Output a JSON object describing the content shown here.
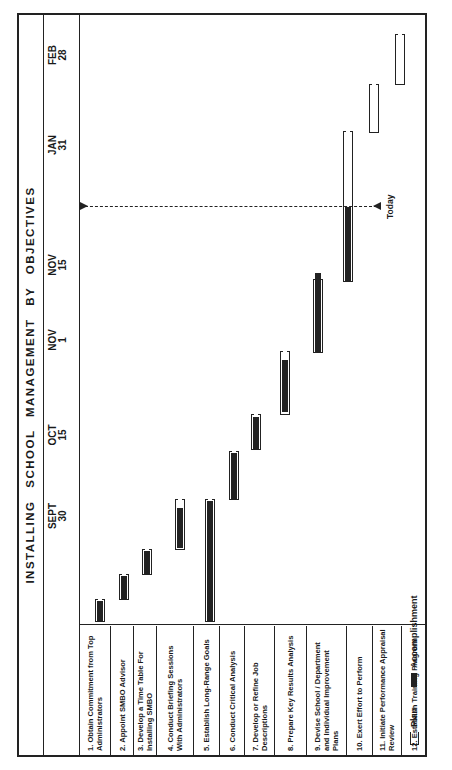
{
  "chart_data": {
    "type": "gantt",
    "title": "INSTALLING SCHOOL MANAGEMENT BY OBJECTIVES",
    "orientation": "rotated 90° counterclockwise",
    "time_ticks": [
      {
        "label_line1": "SEPT",
        "label_line2": "30"
      },
      {
        "label_line1": "OCT",
        "label_line2": "15"
      },
      {
        "label_line1": "NOV",
        "label_line2": "1"
      },
      {
        "label_line1": "NOV",
        "label_line2": "15"
      },
      {
        "label_line1": "JAN",
        "label_line2": "31"
      },
      {
        "label_line1": "FEB",
        "label_line2": "28"
      }
    ],
    "today_marker": "Today",
    "legend": [
      {
        "key": "plan",
        "label": "Plan",
        "style": "open bracket"
      },
      {
        "key": "accomplishment",
        "label": "Accomplishment",
        "style": "solid bar"
      }
    ],
    "tasks": [
      {
        "label": "1. Obtain Commitment from Top Administrators",
        "plan": [
          0,
          22
        ],
        "accomplished": [
          1,
          21
        ]
      },
      {
        "label": "2. Appoint SMBO Advisor",
        "plan": [
          22,
          47
        ],
        "accomplished": [
          23,
          46
        ]
      },
      {
        "label": "3. Develop a Time Table For Installing SMBO",
        "plan": [
          47,
          72
        ],
        "accomplished": [
          48,
          71
        ]
      },
      {
        "label": "4. Conduct Briefing Sessions With Administrators",
        "plan": [
          72,
          122
        ],
        "accomplished": [
          74,
          114
        ]
      },
      {
        "label": "5. Establish Long-Range Goals",
        "plan": [
          0,
          122
        ],
        "accomplished": [
          1,
          121
        ]
      },
      {
        "label": "6. Conduct Critical Analysis",
        "plan": [
          122,
          170
        ],
        "accomplished": [
          123,
          169
        ]
      },
      {
        "label": "7. Develop or Refine Job Descriptions",
        "plan": [
          172,
          207
        ],
        "accomplished": [
          173,
          205
        ]
      },
      {
        "label": "8. Prepare Key Results Analysis",
        "plan": [
          207,
          270
        ],
        "accomplished": [
          210,
          262
        ]
      },
      {
        "label": "9. Devise School / Department and Individual Improvement Plans",
        "plan": [
          269,
          342
        ],
        "accomplished": [
          270,
          349
        ]
      },
      {
        "label": "10. Exert Effort to Perform",
        "plan": [
          340,
          490
        ],
        "accomplished": [
          340,
          415
        ]
      },
      {
        "label": "11. Initiate Performance Appraisal Review",
        "plan": [
          489,
          537
        ],
        "accomplished": null
      },
      {
        "label": "12. Establish Training Program",
        "plan": [
          537,
          587
        ],
        "accomplished": null
      }
    ],
    "axis_positions": {
      "SEPT 30": 106,
      "OCT 15": 187,
      "NOV 1": 282,
      "NOV 15": 357,
      "JAN 31": 477,
      "FEB 28": 567,
      "Today": 415
    }
  },
  "title": "INSTALLING SCHOOL MANAGEMENT BY OBJECTIVES",
  "legend": {
    "plan": "Plan",
    "accomplishment": "Accomplishment"
  },
  "today": "Today"
}
